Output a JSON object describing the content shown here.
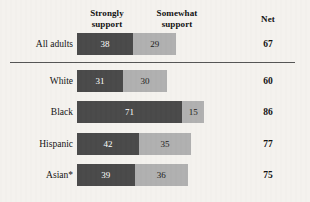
{
  "header": {
    "strongly_support": {
      "line1": "Strongly",
      "line2": "support"
    },
    "somewhat_support": {
      "line1": "Somewhat",
      "line2": "support"
    },
    "net": "Net"
  },
  "colors": {
    "strongly_support": "#4a4a4a",
    "somewhat_support": "#b0b0b0",
    "background": "#f4f2ee",
    "divider": "#555555"
  },
  "chart_data": {
    "type": "bar",
    "title": "",
    "xlabel": "",
    "ylabel": "",
    "orientation": "horizontal",
    "stacked": true,
    "grid": false,
    "legend_position": "top-as-column-headers",
    "xlim": [
      0,
      100
    ],
    "categories": [
      "All adults",
      "White",
      "Black",
      "Hispanic",
      "Asian*"
    ],
    "series": [
      {
        "name": "Strongly support",
        "color": "#4a4a4a",
        "values": [
          38,
          31,
          71,
          42,
          39
        ]
      },
      {
        "name": "Somewhat support",
        "color": "#b0b0b0",
        "values": [
          29,
          30,
          15,
          35,
          36
        ]
      }
    ],
    "net": {
      "name": "Net",
      "values": [
        67,
        60,
        86,
        77,
        75
      ]
    },
    "annotations": [
      "Asterisk on Asian* denotes a footnote reference"
    ]
  },
  "rows": [
    {
      "label": "All adults",
      "strong": {
        "value": 38,
        "text": "38"
      },
      "somewhat": {
        "value": 29,
        "text": "29"
      },
      "net": "67",
      "top": 33,
      "divider_below": true
    },
    {
      "label": "White",
      "strong": {
        "value": 31,
        "text": "31"
      },
      "somewhat": {
        "value": 30,
        "text": "30"
      },
      "net": "60",
      "top": 70,
      "divider_below": false
    },
    {
      "label": "Black",
      "strong": {
        "value": 71,
        "text": "71"
      },
      "somewhat": {
        "value": 15,
        "text": "15"
      },
      "net": "86",
      "top": 101,
      "divider_below": false
    },
    {
      "label": "Hispanic",
      "strong": {
        "value": 42,
        "text": "42"
      },
      "somewhat": {
        "value": 35,
        "text": "35"
      },
      "net": "77",
      "top": 133,
      "divider_below": false
    },
    {
      "label": "Asian*",
      "strong": {
        "value": 39,
        "text": "39"
      },
      "somewhat": {
        "value": 36,
        "text": "36"
      },
      "net": "75",
      "top": 164,
      "divider_below": false
    }
  ],
  "scale": {
    "px_per_unit": 1.48
  }
}
